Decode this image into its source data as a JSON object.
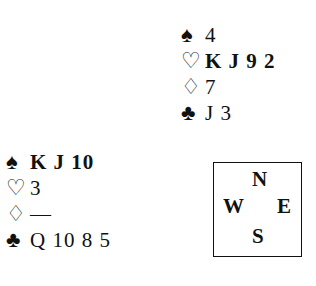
{
  "north": {
    "spades": "4",
    "hearts": "K J 9 2",
    "diamonds": "7",
    "clubs": "J 3"
  },
  "west": {
    "spades": "K J 10",
    "hearts": "3",
    "diamonds": "—",
    "clubs": "Q 10 8 5"
  },
  "suits": {
    "spade": "♠",
    "heart": "♡",
    "diamond": "♢",
    "club": "♣"
  },
  "compass": {
    "n": "N",
    "w": "W",
    "e": "E",
    "s": "S"
  }
}
